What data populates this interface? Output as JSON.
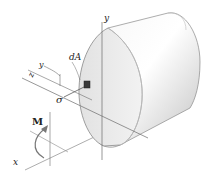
{
  "figure": {
    "labels": {
      "y_axis_top": "y",
      "y_local": "y",
      "z_axis": "z",
      "dA": "dA",
      "sigma": "σ",
      "moment": "M",
      "x_axis": "x"
    },
    "colors": {
      "axis": "#6b6b6b",
      "outline": "#7a7a7a",
      "body_light": "#fafafa",
      "body_shade": "#d2d2d2",
      "face": "#e8e8e8",
      "element": "#3a3a3a"
    }
  }
}
